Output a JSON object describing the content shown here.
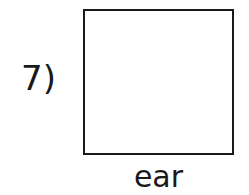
{
  "item": {
    "number_label": "7)",
    "word": "ear"
  }
}
